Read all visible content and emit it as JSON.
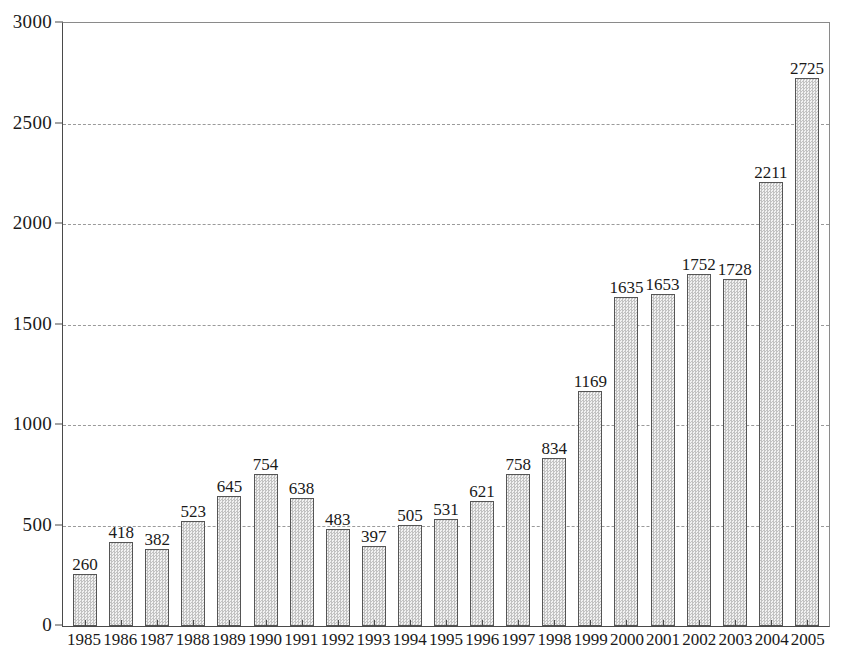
{
  "chart_data": {
    "type": "bar",
    "title": "",
    "subtitle": "",
    "xlabel": "",
    "ylabel": "",
    "legend": [],
    "grid": true,
    "ylim": [
      0,
      3000
    ],
    "ytick_step": 500,
    "yticks": [
      "0",
      "500",
      "1000",
      "1500",
      "2000",
      "2500",
      "3000"
    ],
    "categories": [
      "1985",
      "1986",
      "1987",
      "1988",
      "1989",
      "1990",
      "1991",
      "1992",
      "1993",
      "1994",
      "1995",
      "1996",
      "1997",
      "1998",
      "1999",
      "2000",
      "2001",
      "2002",
      "2003",
      "2004",
      "2005"
    ],
    "values": [
      260,
      418,
      382,
      523,
      645,
      754,
      638,
      483,
      397,
      505,
      531,
      621,
      758,
      834,
      1169,
      1635,
      1653,
      1752,
      1728,
      2211,
      2725
    ],
    "value_labels": [
      "260",
      "418",
      "382",
      "523",
      "645",
      "754",
      "638",
      "483",
      "397",
      "505",
      "531",
      "621",
      "758",
      "834",
      "1169",
      "1635",
      "1653",
      "1752",
      "1728",
      "2211",
      "2725"
    ]
  },
  "style": {
    "bar_fill": "#d9d9d9",
    "bar_border": "#555555",
    "gridline_color": "#9a9a9a",
    "axis_color": "#4a4a4a",
    "frame_color": "#8a8a8a",
    "text_color": "#1a1a1a",
    "background": "#ffffff"
  }
}
